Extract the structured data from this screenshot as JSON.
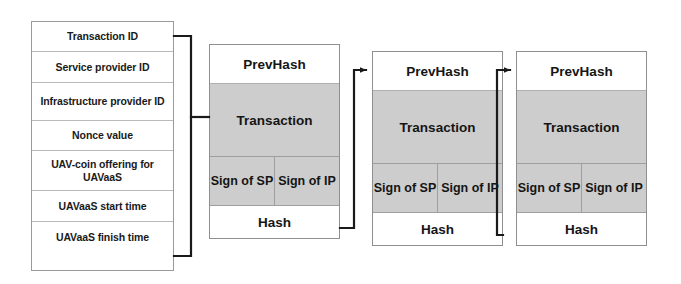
{
  "diagram": {
    "colors": {
      "block_fill_gray": "#cdcdcd",
      "block_fill_white": "#ffffff",
      "border": "#8f8f8f",
      "line": "#1a1a1a",
      "text": "#151515"
    }
  },
  "transaction_fields": {
    "name": "Transaction fields",
    "rows": [
      {
        "label": "Transaction ID"
      },
      {
        "label": "Service provider ID"
      },
      {
        "label": "Infrastructure provider ID"
      },
      {
        "label": "Nonce value"
      },
      {
        "label": "UAV-coin offering for UAVaaS"
      },
      {
        "label": "UAVaaS start time"
      },
      {
        "label": "UAVaaS finish time"
      }
    ]
  },
  "blocks": [
    {
      "index": 1,
      "prevhash_label": "PrevHash",
      "transaction_label": "Transaction",
      "sign_sp_label": "Sign of SP",
      "sign_ip_label": "Sign of IP",
      "hash_label": "Hash"
    },
    {
      "index": 2,
      "prevhash_label": "PrevHash",
      "transaction_label": "Transaction",
      "sign_sp_label": "Sign of SP",
      "sign_ip_label": "Sign of IP",
      "hash_label": "Hash"
    },
    {
      "index": 3,
      "prevhash_label": "PrevHash",
      "transaction_label": "Transaction",
      "sign_sp_label": "Sign of SP",
      "sign_ip_label": "Sign of IP",
      "hash_label": "Hash"
    }
  ],
  "connectors": [
    {
      "from": "block-1-hash",
      "to": "block-2-prevhash"
    },
    {
      "from": "block-2-hash",
      "to": "block-3-prevhash"
    }
  ]
}
